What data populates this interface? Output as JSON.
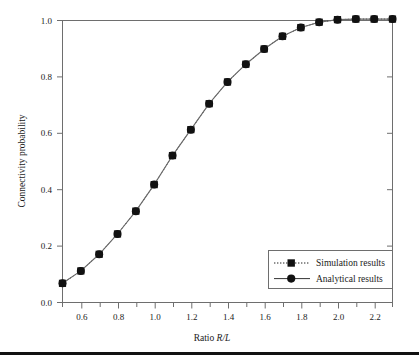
{
  "chart_data": {
    "type": "line",
    "title": "",
    "subtitle": "",
    "xlabel_prefix": "Ratio ",
    "xlabel_italic": "R/L",
    "xlabel": "Ratio R/L",
    "ylabel": "Connectivity probability",
    "xlim": [
      0.5,
      2.3
    ],
    "ylim": [
      0.0,
      1.0
    ],
    "grid": false,
    "legend_position": "lower right",
    "xticks": [
      0.6,
      0.8,
      1.0,
      1.2,
      1.4,
      1.6,
      1.8,
      2.0,
      2.2
    ],
    "xtick_labels": [
      "0.6",
      "0.8",
      "1.0",
      "1.2",
      "1.4",
      "1.6",
      "1.8",
      "2.0",
      "2.2"
    ],
    "xminor_ticks": [
      0.5,
      0.7,
      0.9,
      1.1,
      1.3,
      1.5,
      1.7,
      1.9,
      2.1,
      2.3
    ],
    "yticks": [
      0.0,
      0.2,
      0.4,
      0.6,
      0.8,
      1.0
    ],
    "ytick_labels": [
      "0.0",
      "0.2",
      "0.4",
      "0.6",
      "0.8",
      "1.0"
    ],
    "x": [
      0.5,
      0.6,
      0.7,
      0.8,
      0.9,
      1.0,
      1.1,
      1.2,
      1.3,
      1.4,
      1.5,
      1.6,
      1.7,
      1.8,
      1.9,
      2.0,
      2.1,
      2.2,
      2.3
    ],
    "series": [
      {
        "name": "Simulation results",
        "marker": "square",
        "linestyle": "dotted",
        "color": "#111111",
        "values": [
          0.068,
          0.112,
          0.171,
          0.243,
          0.324,
          0.418,
          0.521,
          0.613,
          0.705,
          0.782,
          0.845,
          0.899,
          0.944,
          0.975,
          0.994,
          1.003,
          1.005,
          1.005,
          1.005
        ]
      },
      {
        "name": "Analytical results",
        "marker": "circle",
        "linestyle": "solid",
        "color": "#555555",
        "values": [
          0.068,
          0.112,
          0.171,
          0.243,
          0.324,
          0.418,
          0.521,
          0.613,
          0.705,
          0.782,
          0.845,
          0.899,
          0.944,
          0.975,
          0.994,
          1.003,
          1.005,
          1.005,
          1.005
        ]
      }
    ]
  },
  "axes": {
    "ylabel": "Connectivity probability",
    "xlabel_prefix": "Ratio ",
    "xlabel_italic": "R/L"
  },
  "legend": {
    "entries": [
      {
        "label": "Simulation results"
      },
      {
        "label": "Analytical results"
      }
    ]
  },
  "ticks": {
    "x": [
      "0.6",
      "0.8",
      "1.0",
      "1.2",
      "1.4",
      "1.6",
      "1.8",
      "2.0",
      "2.2"
    ],
    "y": [
      "0.0",
      "0.2",
      "0.4",
      "0.6",
      "0.8",
      "1.0"
    ]
  },
  "colors": {
    "frame": "#6e6e6e",
    "marker": "#111111",
    "analytical_line": "#6a6a6a",
    "simulation_line": "#222222",
    "text": "#1a1a1a",
    "footer_rule": "#111111"
  }
}
